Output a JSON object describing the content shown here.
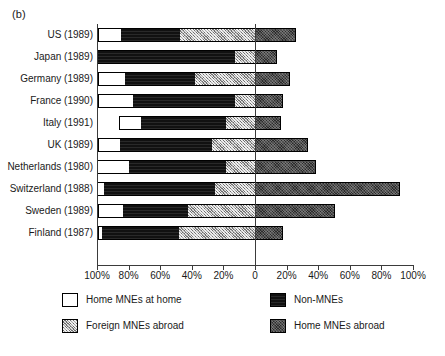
{
  "figure": {
    "panel_label": "(b)"
  },
  "chart_data": {
    "type": "bar",
    "subtype": "diverging-stacked-horizontal",
    "title": "",
    "xlabel": "",
    "ylabel": "",
    "xlim": [
      -100,
      100
    ],
    "xticks": [
      -100,
      -80,
      -60,
      -40,
      -20,
      0,
      20,
      40,
      60,
      80,
      100
    ],
    "xtick_labels": [
      "100%",
      "80%",
      "60%",
      "40%",
      "20%",
      "0",
      "20%",
      "40%",
      "60%",
      "80%",
      "100%"
    ],
    "grid": false,
    "zero_line": true,
    "legend_position": "below",
    "categories": [
      "US (1989)",
      "Japan (1989)",
      "Germany (1989)",
      "France (1990)",
      "Italy (1991)",
      "UK (1989)",
      "Netherlands (1980)",
      "Switzerland (1988)",
      "Sweden (1989)",
      "Finland (1987)"
    ],
    "series": [
      {
        "name": "Home MNEs at home",
        "side": "left",
        "color": "#ffffff",
        "pattern": "solid-white",
        "values": [
          14.5,
          0.0,
          17.0,
          22.0,
          14.0,
          14.0,
          20.0,
          4.0,
          16.0,
          2.5
        ]
      },
      {
        "name": "Non-MNEs",
        "side": "left",
        "color": "#111111",
        "pattern": "solid-black",
        "values": [
          37.5,
          87.0,
          44.5,
          64.5,
          54.0,
          58.0,
          61.5,
          70.5,
          41.0,
          48.5
        ]
      },
      {
        "name": "Foreign MNEs abroad",
        "side": "left",
        "color": "#a8a8a8",
        "pattern": "light-crosshatch",
        "values": [
          48.0,
          13.0,
          38.5,
          13.5,
          19.0,
          28.0,
          19.0,
          26.0,
          43.0,
          49.0
        ]
      },
      {
        "name": "Home MNEs abroad",
        "side": "right",
        "color": "#2b2b2b",
        "pattern": "dark-crosshatch",
        "values": [
          25.0,
          13.0,
          21.5,
          17.0,
          16.0,
          33.0,
          38.0,
          91.0,
          50.0,
          17.0
        ]
      }
    ],
    "legend": [
      {
        "label": "Home MNEs at home",
        "swatch": "solid-white",
        "color": "#ffffff"
      },
      {
        "label": "Non-MNEs",
        "swatch": "solid-black",
        "color": "#111111"
      },
      {
        "label": "Foreign MNEs abroad",
        "swatch": "light-crosshatch",
        "color": "#a8a8a8"
      },
      {
        "label": "Home MNEs abroad",
        "swatch": "dark-crosshatch",
        "color": "#2b2b2b"
      }
    ]
  }
}
